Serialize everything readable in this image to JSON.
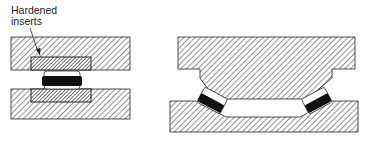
{
  "figure": {
    "left_diagram": {
      "name": "flat-die-with-hardened-inserts",
      "label": [
        "Hardened",
        "inserts"
      ]
    },
    "right_diagram": {
      "name": "contoured-die-with-inclined-rollers"
    }
  },
  "colors": {
    "hatch": "#555555",
    "outline": "#222222",
    "roller": "#111111",
    "background": "#ffffff"
  }
}
